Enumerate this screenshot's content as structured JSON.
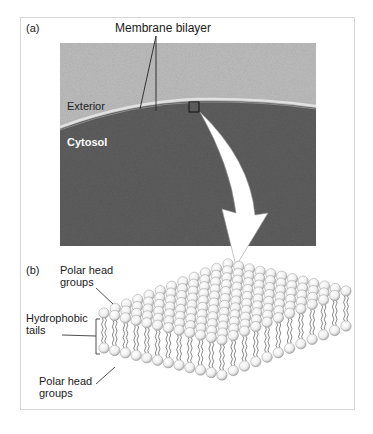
{
  "figure": {
    "panel_a": {
      "label": "(a)",
      "title": "Membrane bilayer",
      "exterior_label": "Exterior",
      "cytosol_label": "Cytosol",
      "colors": {
        "exterior": "#b4b4b4",
        "cytosol": "#5a5a5a",
        "membrane": "#d8d8d8"
      }
    },
    "panel_b": {
      "label": "(b)",
      "top_heads": [
        "Polar head",
        "groups"
      ],
      "tails": [
        "Hydrophobic",
        "tails"
      ],
      "bottom_heads": [
        "Polar head",
        "groups"
      ]
    }
  }
}
